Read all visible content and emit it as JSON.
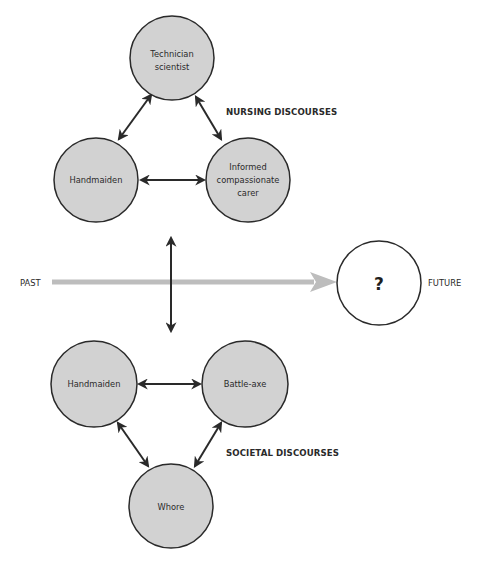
{
  "colors": {
    "background": "#ffffff",
    "node_fill": "#d2d2d2",
    "node_stroke": "#2a2a2a",
    "future_fill": "#ffffff",
    "arrow": "#2a2a2a",
    "timeline": "#bdbdbd"
  },
  "nursing": {
    "title": "NURSING DISCOURSES",
    "nodes": [
      {
        "id": "technician-scientist",
        "lines": [
          "Technician",
          "scientist"
        ]
      },
      {
        "id": "handmaiden",
        "lines": [
          "Handmaiden"
        ]
      },
      {
        "id": "informed-compassionate-carer",
        "lines": [
          "Informed",
          "compassionate",
          "carer"
        ]
      }
    ]
  },
  "societal": {
    "title": "SOCIETAL DISCOURSES",
    "nodes": [
      {
        "id": "handmaiden",
        "lines": [
          "Handmaiden"
        ]
      },
      {
        "id": "battle-axe",
        "lines": [
          "Battle-axe"
        ]
      },
      {
        "id": "whore",
        "lines": [
          "Whore"
        ]
      }
    ]
  },
  "timeline": {
    "start_label": "PAST",
    "end_label": "FUTURE",
    "future_node": "?"
  }
}
